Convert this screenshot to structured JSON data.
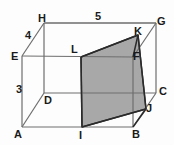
{
  "figure": {
    "type": "geometry-diagram",
    "shape": "rectangular-prism-with-shaded-cross-section",
    "background_color": "#fdfdfd",
    "line_color": "#6e6e6e",
    "bold_line_color": "#2b2b2b",
    "shade_fill": "#a8a8a8",
    "text_color": "#1a1a1a"
  },
  "vertices": [
    {
      "id": "A",
      "label": "A",
      "x": 22,
      "y": 127,
      "lx": 14,
      "ly": 129
    },
    {
      "id": "B",
      "label": "B",
      "x": 133,
      "y": 127,
      "lx": 132,
      "ly": 129
    },
    {
      "id": "C",
      "label": "C",
      "x": 156,
      "y": 93,
      "lx": 159,
      "ly": 86
    },
    {
      "id": "D",
      "label": "D",
      "x": 44,
      "y": 93,
      "lx": 44,
      "ly": 95
    },
    {
      "id": "E",
      "label": "E",
      "x": 22,
      "y": 56,
      "lx": 11,
      "ly": 51
    },
    {
      "id": "F",
      "label": "F",
      "x": 133,
      "y": 57,
      "lx": 133,
      "ly": 51
    },
    {
      "id": "G",
      "label": "G",
      "x": 156,
      "y": 23,
      "lx": 157,
      "ly": 16
    },
    {
      "id": "H",
      "label": "H",
      "x": 44,
      "y": 23,
      "lx": 38,
      "ly": 13
    },
    {
      "id": "I",
      "label": "I",
      "x": 82,
      "y": 127,
      "lx": 79,
      "ly": 130
    },
    {
      "id": "J",
      "label": "J",
      "x": 146,
      "y": 109,
      "lx": 146,
      "ly": 103
    },
    {
      "id": "K",
      "label": "K",
      "x": 138,
      "y": 35,
      "lx": 134,
      "ly": 26
    },
    {
      "id": "L",
      "label": "L",
      "x": 81,
      "y": 57,
      "lx": 71,
      "ly": 44
    }
  ],
  "dimensions": [
    {
      "id": "top",
      "label": "5",
      "lx": 95,
      "ly": 11
    },
    {
      "id": "slant",
      "label": "4",
      "lx": 25,
      "ly": 30
    },
    {
      "id": "left",
      "label": "3",
      "lx": 16,
      "ly": 84
    }
  ],
  "shaded_region": {
    "name": "cross-section",
    "vertices": [
      "I",
      "L",
      "K",
      "J"
    ],
    "fill": "#a8a8a8"
  }
}
